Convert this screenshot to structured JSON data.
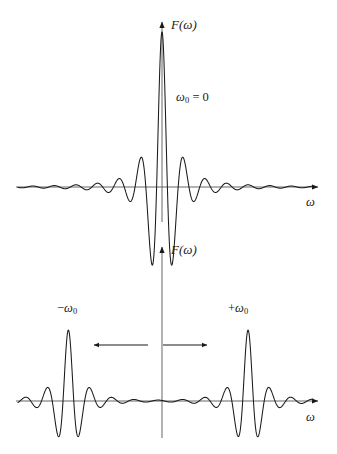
{
  "figure": {
    "title_present": false,
    "background_color": "#ffffff",
    "stroke_color": "#1a1a1a",
    "width": 337,
    "height": 454
  },
  "panels": [
    {
      "id": "panel-top",
      "y_axis_label": "F(ω)",
      "x_axis_label": "ω",
      "annotation": "ω₀ = 0",
      "annotation_base": "ω",
      "annotation_sub": "0",
      "annotation_rest": " = 0",
      "origin_x": 162,
      "baseline_y": 187,
      "axis_top_y": 18,
      "axis_left_x": 16,
      "axis_right_x": 322,
      "axis_bottom_y": 222
    },
    {
      "id": "panel-bottom",
      "y_axis_label": "F(ω)",
      "x_axis_label": "ω",
      "left_peak_label_sign": "−",
      "left_peak_label_base": "ω",
      "left_peak_label_sub": "0",
      "right_peak_label_sign": "+",
      "right_peak_label_base": "ω",
      "right_peak_label_sub": "0",
      "origin_x": 162,
      "baseline_y": 401,
      "axis_top_y": 243,
      "axis_left_x": 16,
      "axis_right_x": 322,
      "axis_bottom_y": 438,
      "arrow_left": {
        "x_from": 148,
        "x_to": 91,
        "y": 345
      },
      "arrow_right": {
        "x_from": 163,
        "x_to": 211,
        "y": 345
      }
    }
  ],
  "chart_data": {
    "type": "line",
    "title": "",
    "xlabel": "ω",
    "ylabel": "F(ω)",
    "grid": false,
    "legend": null,
    "series": [
      {
        "name": "panel-top",
        "function": "sinc-envelope oscillation centered at 0",
        "centers": [
          0
        ],
        "peak_amplitude": 1.0,
        "carrier_cycles_per_unit": 7.0,
        "envelope_width": 0.085,
        "x_range": [
          -1.0,
          1.0
        ],
        "ylim": [
          -1.0,
          1.0
        ],
        "baseline_value": 0
      },
      {
        "name": "panel-bottom",
        "function": "two sinc-envelope oscillations centered at -omega_0 and +omega_0",
        "centers": [
          -0.62,
          0.57
        ],
        "peak_amplitude": 0.43,
        "carrier_cycles_per_unit": 7.0,
        "envelope_width": 0.085,
        "x_range": [
          -1.0,
          1.0
        ],
        "ylim": [
          -0.5,
          0.5
        ],
        "baseline_value": 0
      }
    ],
    "annotations": [
      {
        "text": "ω₀ = 0",
        "panel": "panel-top",
        "x": 0.1,
        "y": 0.62
      },
      {
        "text": "−ω₀",
        "panel": "panel-bottom",
        "x": -0.62,
        "y": 0.54
      },
      {
        "text": "+ω₀",
        "panel": "panel-bottom",
        "x": 0.57,
        "y": 0.54
      },
      {
        "text": "left-shift-arrow",
        "panel": "panel-bottom"
      },
      {
        "text": "right-shift-arrow",
        "panel": "panel-bottom"
      }
    ]
  }
}
